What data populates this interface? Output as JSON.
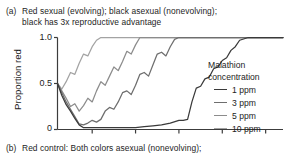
{
  "panel": {
    "caption_a_tag": "(a)",
    "caption_a_line1": "Red sexual (evolving); black asexual (nonevolving);",
    "caption_a_line2": "black has 3x reproductive advantage",
    "caption_b_tag": "(b)",
    "caption_b_line1": "Red control: Both colors asexual (nonevolving);"
  },
  "legend": {
    "title_line1": "Malathion",
    "title_line2": "concentration"
  },
  "chart_data": {
    "type": "line",
    "title": "",
    "xlabel": "",
    "ylabel": "Proportion red",
    "ylim": [
      0,
      1
    ],
    "yticks": [
      0,
      0.5,
      1
    ],
    "ytick_labels": [
      "0",
      "0.5",
      "1.0"
    ],
    "xlim": [
      0,
      52
    ],
    "xticks": [
      8,
      18,
      28,
      38,
      48
    ],
    "xtick_labels": [
      "",
      "",
      "",
      "",
      ""
    ],
    "grid": false,
    "legend_position": "right",
    "legend_title": "Malathion concentration",
    "series": [
      {
        "name": "1 ppm",
        "color": "#3a3a3a",
        "x": [
          0,
          1,
          2,
          3,
          4,
          5,
          6,
          7,
          8,
          9,
          10,
          12,
          14,
          16,
          18,
          20,
          22,
          24,
          26,
          28,
          29,
          30,
          31,
          32,
          33,
          34,
          35,
          36,
          37,
          38,
          39,
          40,
          41,
          42,
          44,
          46,
          48,
          50,
          52
        ],
        "values": [
          0.5,
          0.37,
          0.27,
          0.2,
          0.12,
          0.05,
          0.02,
          0.02,
          0.02,
          0.02,
          0.02,
          0.02,
          0.02,
          0.02,
          0.02,
          0.03,
          0.04,
          0.05,
          0.07,
          0.1,
          0.1,
          0.11,
          0.3,
          0.45,
          0.47,
          0.55,
          0.57,
          0.66,
          0.68,
          0.75,
          0.78,
          0.86,
          0.9,
          0.97,
          1.0,
          1.0,
          1.0,
          1.0,
          1.0
        ]
      },
      {
        "name": "3 ppm",
        "color": "#6e6e6e",
        "x": [
          0,
          1,
          2,
          3,
          4,
          5,
          6,
          7,
          8,
          9,
          10,
          11,
          12,
          13,
          14,
          15,
          16,
          17,
          18,
          19,
          20,
          21,
          22,
          23,
          24,
          25,
          26,
          27,
          28,
          30,
          34,
          38,
          42,
          46,
          52
        ],
        "values": [
          0.5,
          0.4,
          0.3,
          0.22,
          0.14,
          0.06,
          0.05,
          0.07,
          0.1,
          0.08,
          0.11,
          0.2,
          0.24,
          0.22,
          0.3,
          0.4,
          0.42,
          0.38,
          0.48,
          0.6,
          0.62,
          0.58,
          0.7,
          0.82,
          0.84,
          0.8,
          0.9,
          0.98,
          1.0,
          1.0,
          1.0,
          1.0,
          1.0,
          1.0,
          1.0
        ]
      },
      {
        "name": "5 ppm",
        "color": "#8c8c8c",
        "x": [
          0,
          1,
          2,
          3,
          4,
          5,
          6,
          7,
          8,
          9,
          10,
          11,
          12,
          13,
          14,
          15,
          16,
          17,
          18,
          19,
          20,
          24,
          28,
          34,
          40,
          46,
          52
        ],
        "values": [
          0.5,
          0.42,
          0.34,
          0.25,
          0.28,
          0.2,
          0.26,
          0.34,
          0.3,
          0.42,
          0.52,
          0.48,
          0.58,
          0.68,
          0.64,
          0.74,
          0.85,
          0.82,
          0.92,
          1.0,
          1.0,
          1.0,
          1.0,
          1.0,
          1.0,
          1.0,
          1.0
        ]
      },
      {
        "name": "10 ppm",
        "color": "#a3a3a3",
        "x": [
          0,
          1,
          2,
          3,
          4,
          5,
          6,
          7,
          8,
          9,
          10,
          11,
          12,
          14,
          18,
          22,
          28,
          34,
          40,
          46,
          52
        ],
        "values": [
          0.5,
          0.44,
          0.52,
          0.62,
          0.6,
          0.72,
          0.82,
          0.8,
          0.9,
          0.97,
          1.0,
          1.0,
          1.0,
          1.0,
          1.0,
          1.0,
          1.0,
          1.0,
          1.0,
          1.0,
          1.0
        ]
      }
    ]
  }
}
